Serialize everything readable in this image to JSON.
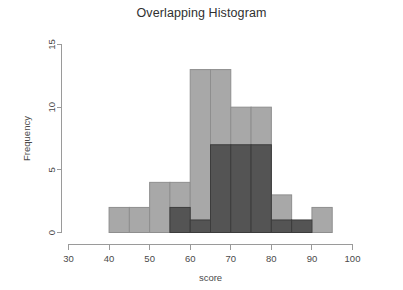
{
  "chart_data": {
    "type": "bar",
    "title": "Overlapping Histogram",
    "xlabel": "score",
    "ylabel": "Frequency",
    "xlim": [
      30,
      100
    ],
    "ylim": [
      0,
      15
    ],
    "xticks": [
      30,
      40,
      50,
      60,
      70,
      80,
      90,
      100
    ],
    "xtick_labels": [
      "30",
      "40",
      "50",
      "60",
      "70",
      "80",
      "90",
      "100"
    ],
    "yticks": [
      0,
      5,
      10,
      15
    ],
    "ytick_labels": [
      "0",
      "5",
      "10",
      "15"
    ],
    "grid": false,
    "legend": "none",
    "binwidth": 5,
    "series": [
      {
        "name": "series-light",
        "color": "#a8a8a8",
        "bins": [
          {
            "x0": 40,
            "x1": 45,
            "value": 2
          },
          {
            "x0": 45,
            "x1": 50,
            "value": 2
          },
          {
            "x0": 50,
            "x1": 55,
            "value": 4
          },
          {
            "x0": 55,
            "x1": 60,
            "value": 4
          },
          {
            "x0": 60,
            "x1": 65,
            "value": 13
          },
          {
            "x0": 65,
            "x1": 70,
            "value": 13
          },
          {
            "x0": 70,
            "x1": 75,
            "value": 10
          },
          {
            "x0": 75,
            "x1": 80,
            "value": 10
          },
          {
            "x0": 80,
            "x1": 85,
            "value": 3
          },
          {
            "x0": 90,
            "x1": 95,
            "value": 2
          }
        ]
      },
      {
        "name": "series-dark",
        "color": "#545454",
        "bins": [
          {
            "x0": 55,
            "x1": 60,
            "value": 2
          },
          {
            "x0": 60,
            "x1": 65,
            "value": 1
          },
          {
            "x0": 65,
            "x1": 70,
            "value": 7
          },
          {
            "x0": 70,
            "x1": 75,
            "value": 7
          },
          {
            "x0": 75,
            "x1": 80,
            "value": 7
          },
          {
            "x0": 80,
            "x1": 85,
            "value": 1
          },
          {
            "x0": 85,
            "x1": 90,
            "value": 1
          }
        ]
      }
    ]
  }
}
